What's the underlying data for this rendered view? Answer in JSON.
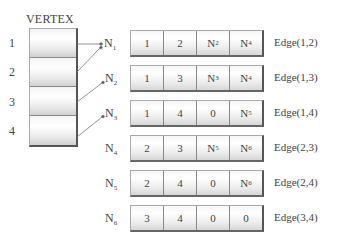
{
  "vertex": {
    "title": "VERTEX",
    "labels": [
      "1",
      "2",
      "3",
      "4"
    ]
  },
  "nodes": [
    {
      "name": "N",
      "sub": "1",
      "cells": [
        {
          "t": "1",
          "s": ""
        },
        {
          "t": "2",
          "s": ""
        },
        {
          "t": "N",
          "s": "2"
        },
        {
          "t": "N",
          "s": "4"
        }
      ],
      "edge": "Edge(1,2)"
    },
    {
      "name": "N",
      "sub": "2",
      "cells": [
        {
          "t": "1",
          "s": ""
        },
        {
          "t": "3",
          "s": ""
        },
        {
          "t": "N",
          "s": "3"
        },
        {
          "t": "N",
          "s": "4"
        }
      ],
      "edge": "Edge(1,3)"
    },
    {
      "name": "N",
      "sub": "3",
      "cells": [
        {
          "t": "1",
          "s": ""
        },
        {
          "t": "4",
          "s": ""
        },
        {
          "t": "0",
          "s": ""
        },
        {
          "t": "N",
          "s": "5"
        }
      ],
      "edge": "Edge(1,4)"
    },
    {
      "name": "N",
      "sub": "4",
      "cells": [
        {
          "t": "2",
          "s": ""
        },
        {
          "t": "3",
          "s": ""
        },
        {
          "t": "N",
          "s": "5"
        },
        {
          "t": "N",
          "s": "6"
        }
      ],
      "edge": "Edge(2,3)"
    },
    {
      "name": "N",
      "sub": "5",
      "cells": [
        {
          "t": "2",
          "s": ""
        },
        {
          "t": "4",
          "s": ""
        },
        {
          "t": "0",
          "s": ""
        },
        {
          "t": "N",
          "s": "6"
        }
      ],
      "edge": "Edge(2,4)"
    },
    {
      "name": "N",
      "sub": "6",
      "cells": [
        {
          "t": "3",
          "s": ""
        },
        {
          "t": "4",
          "s": ""
        },
        {
          "t": "0",
          "s": ""
        },
        {
          "t": "0",
          "s": ""
        }
      ],
      "edge": "Edge(3,4)"
    }
  ],
  "pointers": [
    {
      "from_vertex": "1",
      "to": "N1"
    },
    {
      "from_vertex": "2",
      "to": "N1"
    },
    {
      "from_vertex": "3",
      "to": "N2"
    },
    {
      "from_vertex": "4",
      "to": "N3"
    }
  ]
}
